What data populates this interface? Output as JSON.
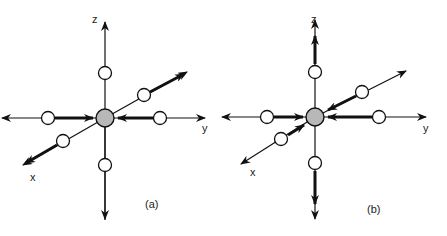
{
  "figure": {
    "panels": [
      {
        "id": "a",
        "caption": "(a)",
        "axis_labels": {
          "x": "x",
          "y": "y",
          "z": "z"
        },
        "center_atom": "shaded",
        "neighbor_atoms": 6,
        "displacements": {
          "z": "none (axis arrows only)",
          "y": "inward toward center",
          "x": "outward away from center"
        }
      },
      {
        "id": "b",
        "caption": "(b)",
        "axis_labels": {
          "x": "x",
          "y": "y",
          "z": "z"
        },
        "center_atom": "shaded",
        "neighbor_atoms": 6,
        "displacements": {
          "z": "outward away from center",
          "y": "inward toward center",
          "x": "inward toward center"
        }
      }
    ],
    "colors": {
      "line": "#111111",
      "center_fill": "#b8b8b8",
      "atom_fill": "#ffffff",
      "background": "#ffffff"
    }
  }
}
